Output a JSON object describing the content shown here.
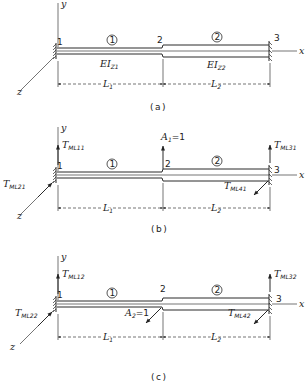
{
  "figure": {
    "axes": {
      "x": "x",
      "y": "y",
      "z": "z"
    },
    "nodes": [
      "1",
      "2",
      "3"
    ],
    "elements": [
      "1",
      "2"
    ],
    "lengths": [
      {
        "base": "L",
        "sub": "1"
      },
      {
        "base": "L",
        "sub": "2"
      }
    ]
  },
  "panels": [
    {
      "caption": "(a)",
      "stiffness": [
        {
          "base": "EI",
          "sub": "Z1"
        },
        {
          "base": "EI",
          "sub": "Z2"
        }
      ]
    },
    {
      "caption": "(b)",
      "loads": {
        "node1_y": {
          "base": "T",
          "sub": "ML11"
        },
        "node1_z": {
          "base": "T",
          "sub": "ML21"
        },
        "node3_y": {
          "base": "T",
          "sub": "ML31"
        },
        "node3_z": {
          "base": "T",
          "sub": "ML41"
        },
        "applied": {
          "base": "A",
          "sub": "1",
          "value": "=1"
        }
      }
    },
    {
      "caption": "(c)",
      "loads": {
        "node1_y": {
          "base": "T",
          "sub": "ML12"
        },
        "node1_z": {
          "base": "T",
          "sub": "ML22"
        },
        "node3_y": {
          "base": "T",
          "sub": "ML32"
        },
        "node3_z": {
          "base": "T",
          "sub": "ML42"
        },
        "applied": {
          "base": "A",
          "sub": "2",
          "value": "=1"
        }
      }
    }
  ]
}
